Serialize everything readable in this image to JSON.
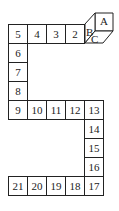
{
  "diagram": {
    "cells": [
      {
        "label": "5",
        "col": 0,
        "row": 0
      },
      {
        "label": "4",
        "col": 1,
        "row": 0
      },
      {
        "label": "3",
        "col": 2,
        "row": 0
      },
      {
        "label": "2",
        "col": 3,
        "row": 0
      },
      {
        "label": "6",
        "col": 0,
        "row": 1
      },
      {
        "label": "7",
        "col": 0,
        "row": 2
      },
      {
        "label": "8",
        "col": 0,
        "row": 3
      },
      {
        "label": "9",
        "col": 0,
        "row": 4
      },
      {
        "label": "10",
        "col": 1,
        "row": 4
      },
      {
        "label": "11",
        "col": 2,
        "row": 4
      },
      {
        "label": "12",
        "col": 3,
        "row": 4
      },
      {
        "label": "13",
        "col": 4,
        "row": 4
      },
      {
        "label": "14",
        "col": 4,
        "row": 5
      },
      {
        "label": "15",
        "col": 4,
        "row": 6
      },
      {
        "label": "16",
        "col": 4,
        "row": 7
      },
      {
        "label": "21",
        "col": 0,
        "row": 8
      },
      {
        "label": "20",
        "col": 1,
        "row": 8
      },
      {
        "label": "19",
        "col": 2,
        "row": 8
      },
      {
        "label": "18",
        "col": 3,
        "row": 8
      },
      {
        "label": "17",
        "col": 4,
        "row": 8
      }
    ],
    "cube": {
      "position_col": 4,
      "position_row": 0,
      "faces": {
        "top": "A",
        "left": "B",
        "front": "C"
      }
    }
  }
}
